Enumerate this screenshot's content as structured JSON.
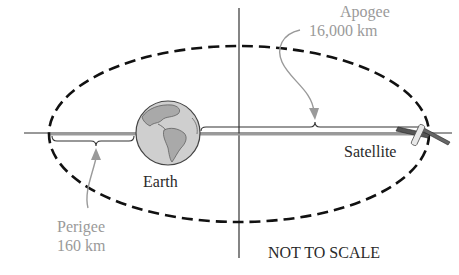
{
  "diagram": {
    "labels": {
      "apogee_name": "Apogee",
      "apogee_value": "16,000 km",
      "perigee_name": "Perigee",
      "perigee_value": "160 km",
      "earth": "Earth",
      "satellite": "Satellite",
      "scale_note": "NOT TO SCALE"
    },
    "colors": {
      "orbit": "#111111",
      "axes": "#333333",
      "annotation": "#9a9a9a",
      "earth_ocean": "#c9c9c9",
      "earth_land": "#a8a8a8",
      "text": "#2a2a2a"
    }
  }
}
